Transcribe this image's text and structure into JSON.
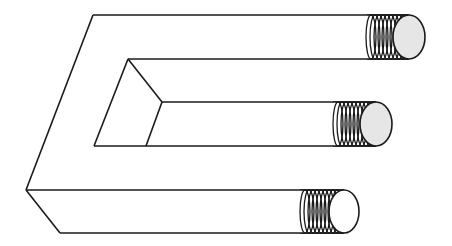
{
  "figure": {
    "stroke_color": "#1a1a1a",
    "fill_color": "#ffffff",
    "end_cap_fill": "#e6e6e6",
    "prongs": [
      {
        "name": "top",
        "top_y": 15,
        "bottom_y": 59,
        "thread_start_x": 367,
        "cap_cx": 409
      },
      {
        "name": "middle",
        "top_y": 102,
        "bottom_y": 146,
        "thread_start_x": 333,
        "cap_cx": 376
      },
      {
        "name": "bottom",
        "top_y": 190,
        "bottom_y": 233,
        "thread_start_x": 300,
        "cap_cx": 344
      }
    ],
    "thread_count": 9
  }
}
